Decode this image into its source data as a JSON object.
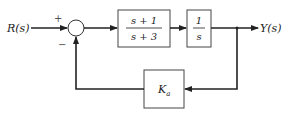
{
  "diagram": {
    "type": "feedback-block-diagram",
    "input": {
      "label": "R(s)"
    },
    "output": {
      "label": "Y(s)"
    },
    "summing_junction": {
      "plus_sign": "+",
      "minus_sign": "−"
    },
    "forward_blocks": [
      {
        "numerator": "s + 1",
        "denominator": "s + 3"
      },
      {
        "numerator": "1",
        "denominator": "s"
      }
    ],
    "feedback_block": {
      "label": "K",
      "subscript": "a"
    }
  }
}
